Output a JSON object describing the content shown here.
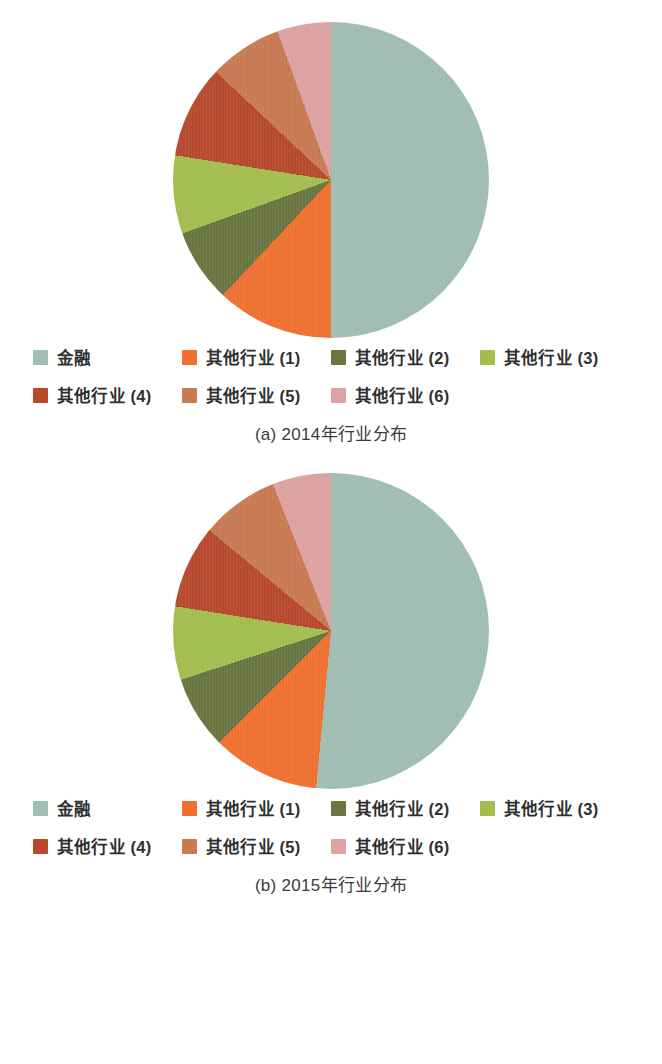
{
  "chart_data": [
    {
      "type": "pie",
      "title": "(a) 2014年行业分布",
      "caption": "(a) 2014年行业分布",
      "panel_id": "a",
      "start_angle_deg": 0,
      "direction": "clockwise",
      "legend_position": "bottom",
      "categories": [
        "金融",
        "其他行业 (1)",
        "其他行业 (2)",
        "其他行业 (3)",
        "其他行业 (4)",
        "其他行业 (5)",
        "其他行业 (6)"
      ],
      "values": [
        50.0,
        12.0,
        7.5,
        8.0,
        9.5,
        7.5,
        5.5
      ],
      "colors": [
        "#9fbdb2",
        "#f2702f",
        "#6b7540",
        "#a3bd4e",
        "#b9482c",
        "#ca7a51",
        "#dda2a0"
      ]
    },
    {
      "type": "pie",
      "title": "(b) 2015年行业分布",
      "caption": "(b) 2015年行业分布",
      "panel_id": "b",
      "start_angle_deg": 0,
      "direction": "clockwise",
      "legend_position": "bottom",
      "categories": [
        "金融",
        "其他行业 (1)",
        "其他行业 (2)",
        "其他行业 (3)",
        "其他行业 (4)",
        "其他行业 (5)",
        "其他行业 (6)"
      ],
      "values": [
        51.5,
        11.0,
        7.5,
        7.5,
        8.5,
        8.0,
        6.0
      ],
      "colors": [
        "#9fbdb2",
        "#f2702f",
        "#6b7540",
        "#a3bd4e",
        "#b9482c",
        "#ca7a51",
        "#dda2a0"
      ]
    }
  ],
  "panels": [
    {
      "caption": "(a) 2014年行业分布",
      "legend": [
        {
          "label": "金融",
          "color": "#9fbdb2"
        },
        {
          "label": "其他行业 (1)",
          "color": "#f2702f"
        },
        {
          "label": "其他行业 (2)",
          "color": "#6b7540"
        },
        {
          "label": "其他行业 (3)",
          "color": "#a3bd4e"
        },
        {
          "label": "其他行业 (4)",
          "color": "#b9482c"
        },
        {
          "label": "其他行业 (5)",
          "color": "#ca7a51"
        },
        {
          "label": "其他行业 (6)",
          "color": "#dda2a0"
        }
      ]
    },
    {
      "caption": "(b) 2015年行业分布",
      "legend": [
        {
          "label": "金融",
          "color": "#9fbdb2"
        },
        {
          "label": "其他行业 (1)",
          "color": "#f2702f"
        },
        {
          "label": "其他行业 (2)",
          "color": "#6b7540"
        },
        {
          "label": "其他行业 (3)",
          "color": "#a3bd4e"
        },
        {
          "label": "其他行业 (4)",
          "color": "#b9482c"
        },
        {
          "label": "其他行业 (5)",
          "color": "#ca7a51"
        },
        {
          "label": "其他行业 (6)",
          "color": "#dda2a0"
        }
      ]
    }
  ]
}
